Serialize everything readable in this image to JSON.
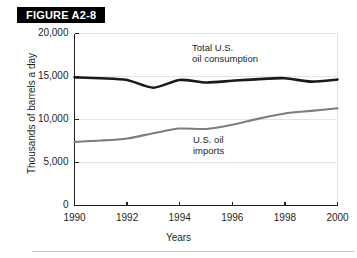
{
  "figure": {
    "banner_label": "FIGURE A2-8"
  },
  "chart_data": {
    "type": "line",
    "title": "FIGURE A2-8",
    "xlabel": "Years",
    "ylabel": "Thousands of barrels a day",
    "xlim": [
      1990,
      2000
    ],
    "ylim": [
      0,
      20000
    ],
    "grid": true,
    "legend_position": "inline-annotations",
    "x": [
      1990,
      1991,
      1992,
      1993,
      1994,
      1995,
      1996,
      1997,
      1998,
      1999,
      2000
    ],
    "xticks": [
      "1990",
      "1992",
      "1994",
      "1996",
      "1998",
      "2000"
    ],
    "xtick_values": [
      1990,
      1992,
      1994,
      1996,
      1998,
      2000
    ],
    "yticks": [
      "0",
      "5,000",
      "10,000",
      "15,000",
      "20,000"
    ],
    "ytick_values": [
      0,
      5000,
      10000,
      15000,
      20000
    ],
    "series": [
      {
        "name": "Total U.S. oil consumption",
        "annotation": "Total U.S.\noil consumption",
        "annotation_line1": "Total U.S.",
        "annotation_line2": "oil consumption",
        "color": "#1a1a1a",
        "width": 2.6,
        "values": [
          14900,
          14800,
          14600,
          13700,
          14600,
          14300,
          14500,
          14700,
          14800,
          14400,
          14650
        ]
      },
      {
        "name": "U.S. oil imports",
        "annotation": "U.S. oil\nimports",
        "annotation_line1": "U.S. oil",
        "annotation_line2": "imports",
        "color": "#7d7d7d",
        "width": 2.1,
        "values": [
          7400,
          7550,
          7800,
          8400,
          8950,
          8900,
          9400,
          10100,
          10700,
          11000,
          11300
        ]
      }
    ]
  },
  "axes": {
    "x_label": "Years",
    "y_label": "Thousands of barrels a day",
    "x_ticks": [
      "1990",
      "1992",
      "1994",
      "1996",
      "1998",
      "2000"
    ],
    "y_ticks": [
      "20,000",
      "15,000",
      "10,000",
      "5,000",
      "0"
    ]
  },
  "colors": {
    "banner_bg": "#000000",
    "banner_text": "#ffffff",
    "consumption_line": "#1a1a1a",
    "imports_line": "#7d7d7d",
    "grid": "#e3e3e3",
    "axis": "#231f20",
    "text": "#231f20",
    "rule": "#c9c9c9"
  }
}
